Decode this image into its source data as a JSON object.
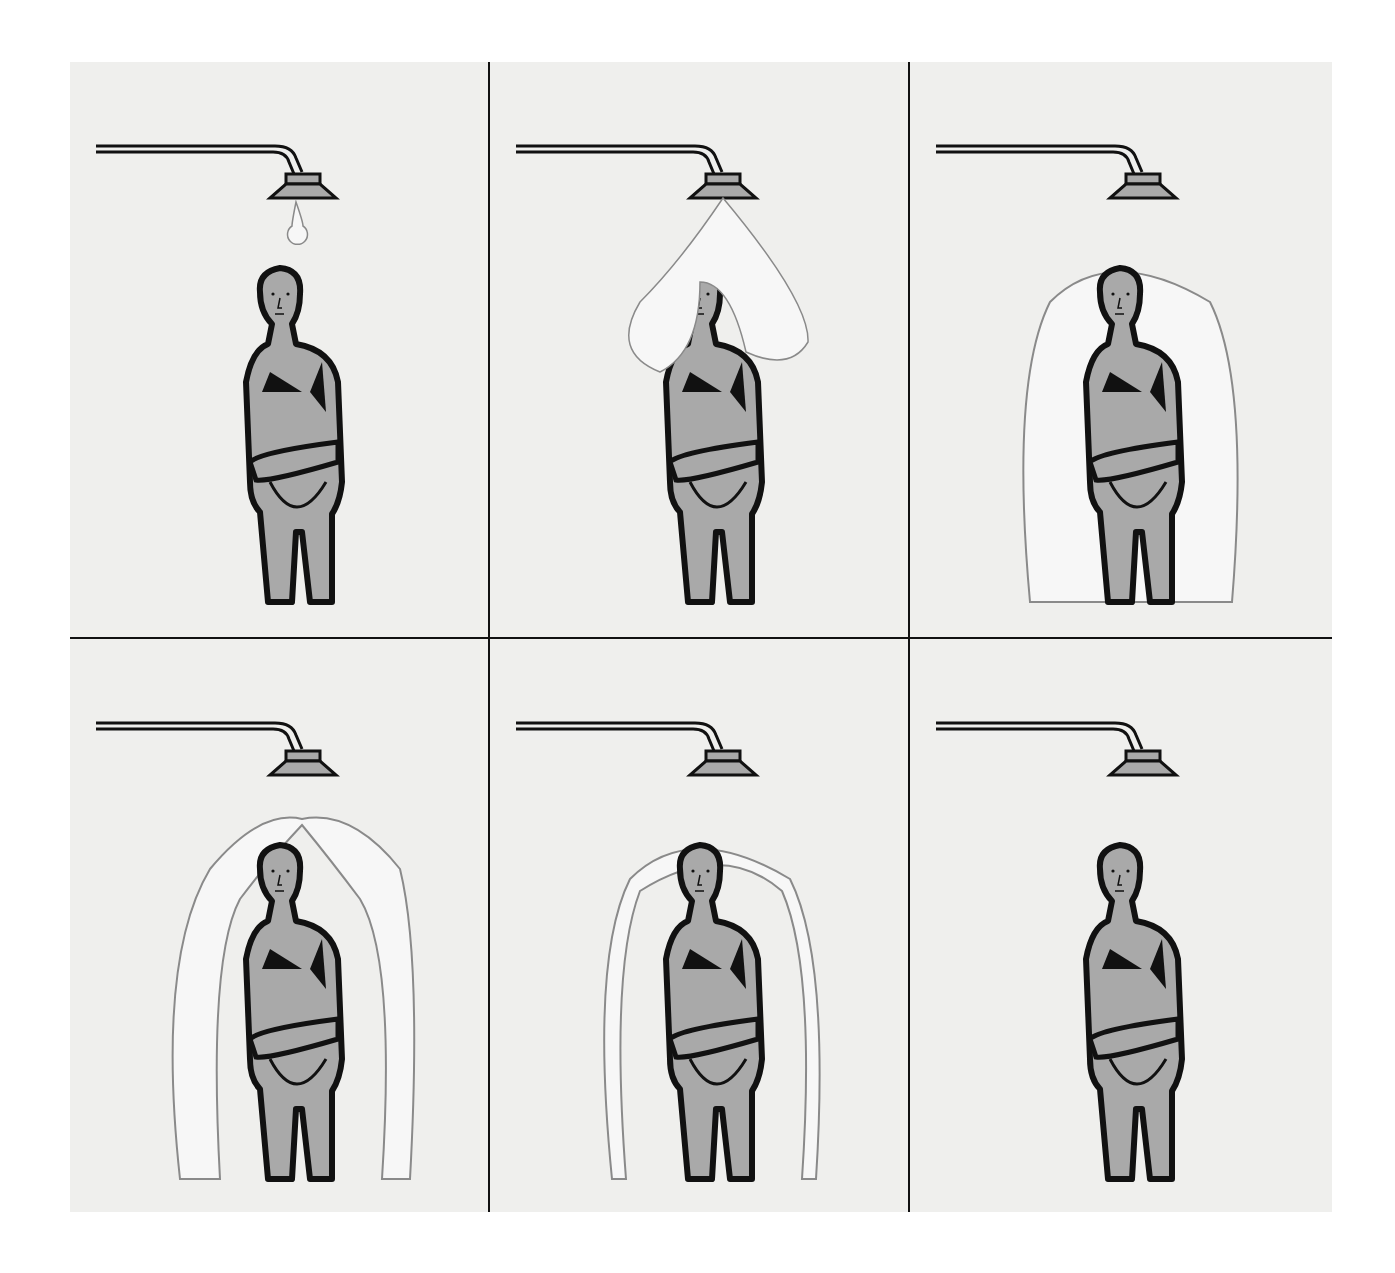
{
  "figure": {
    "colors": {
      "paper": "#efefed",
      "figure_fill": "#a9a9a9",
      "ink": "#111111",
      "water": "#f7f7f7"
    },
    "panels": [
      {
        "id": 1,
        "row": 1,
        "col": 1,
        "stage": "drop forming at shower head"
      },
      {
        "id": 2,
        "row": 1,
        "col": 2,
        "stage": "water cascading over head into heart shape"
      },
      {
        "id": 3,
        "row": 1,
        "col": 3,
        "stage": "water fully encloses body"
      },
      {
        "id": 4,
        "row": 2,
        "col": 1,
        "stage": "water enclosure opening at top"
      },
      {
        "id": 5,
        "row": 2,
        "col": 2,
        "stage": "thin water shell around body"
      },
      {
        "id": 6,
        "row": 2,
        "col": 3,
        "stage": "no water, man alone"
      }
    ]
  }
}
